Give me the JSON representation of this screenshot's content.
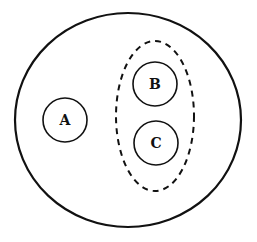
{
  "diagram": {
    "type": "set-containment",
    "outer": {
      "label": "",
      "stroke": "#111111",
      "style": "solid"
    },
    "group": {
      "label": "",
      "stroke": "#111111",
      "style": "dashed",
      "members": [
        "B",
        "C"
      ]
    },
    "nodes": [
      {
        "id": "A",
        "label": "A"
      },
      {
        "id": "B",
        "label": "B"
      },
      {
        "id": "C",
        "label": "C"
      }
    ]
  }
}
